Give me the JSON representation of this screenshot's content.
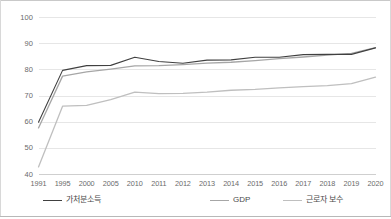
{
  "chart_data": {
    "type": "line",
    "title": "",
    "xlabel": "",
    "ylabel": "",
    "grid": true,
    "legend_position": "bottom",
    "categories": [
      "1991",
      "1995",
      "2000",
      "2005",
      "2010",
      "2011",
      "2012",
      "2013",
      "2014",
      "2015",
      "2016",
      "2017",
      "2018",
      "2019",
      "2020"
    ],
    "ylim": [
      40,
      100
    ],
    "yticks": [
      40,
      50,
      60,
      70,
      80,
      90,
      100
    ],
    "series": [
      {
        "name": "가처분소득",
        "color": "#404040",
        "values": [
          60.0,
          79.8,
          81.6,
          81.7,
          84.8,
          83.2,
          82.5,
          83.7,
          83.8,
          84.8,
          84.8,
          85.8,
          85.9,
          85.9,
          88.4
        ]
      },
      {
        "name": "GDP",
        "color": "#a6a6a6",
        "values": [
          57.8,
          77.6,
          79.2,
          80.3,
          81.5,
          81.6,
          82.0,
          82.6,
          82.9,
          83.5,
          84.3,
          84.9,
          85.6,
          86.3,
          88.5
        ]
      },
      {
        "name": "근로자 보수",
        "color": "#bfbfbf",
        "values": [
          42.9,
          66.1,
          66.4,
          68.6,
          71.5,
          70.9,
          71.0,
          71.5,
          72.2,
          72.5,
          73.1,
          73.6,
          74.0,
          74.7,
          77.2
        ]
      }
    ]
  },
  "axis": {
    "y_tick_labels": [
      "100",
      "90",
      "80",
      "70",
      "60",
      "50",
      "40"
    ],
    "x_tick_labels": [
      "1991",
      "1995",
      "2000",
      "2005",
      "2010",
      "2011",
      "2012",
      "2013",
      "2014",
      "2015",
      "2016",
      "2017",
      "2018",
      "2019",
      "2020"
    ]
  },
  "legend": {
    "items": [
      {
        "label": "가처분소득",
        "color": "#404040"
      },
      {
        "label": "GDP",
        "color": "#a6a6a6"
      },
      {
        "label": "근로자 보수",
        "color": "#bfbfbf"
      }
    ]
  },
  "colors": {
    "gridline": "#e6e6e6",
    "axis_line": "#cfcfcf",
    "tick_text": "#6b6b6b",
    "frame": "#c9c9c9"
  }
}
